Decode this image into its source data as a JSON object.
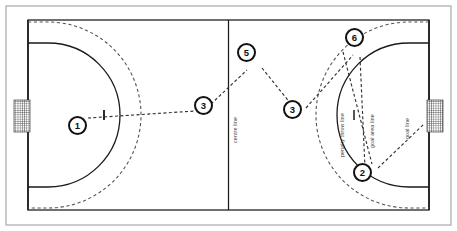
{
  "diagram": {
    "sport": "handball",
    "colors": {
      "court_line": "#1a1a1a",
      "goal_area_line": "#1a1a1a",
      "free_throw_line": "#555555",
      "pass_line": "#333333",
      "frame": "#9a9a9a",
      "net": "#4a4a4a",
      "background": "#ffffff",
      "label_text": "#3a3a3a"
    },
    "frame": {
      "left": 6,
      "top": 6,
      "width": 445,
      "height": 219
    },
    "court": {
      "left": 28,
      "top": 20,
      "width": 401,
      "height": 190
    },
    "centre_line_x": 228.5
  },
  "labels": [
    {
      "name": "centre-line",
      "text": "centre line",
      "x": 232,
      "y": 143,
      "rotation": -90
    },
    {
      "name": "penalty-throw-line",
      "text": "penalty throw line",
      "x": 339,
      "y": 157,
      "rotation": -90
    },
    {
      "name": "goal-area-line",
      "text": "goal area line",
      "x": 369,
      "y": 148,
      "rotation": -90
    },
    {
      "name": "goal-line",
      "text": "goal line",
      "x": 404,
      "y": 139,
      "rotation": -90
    }
  ],
  "goals": [
    {
      "name": "goal-left",
      "x": 14,
      "y": 100,
      "width": 16,
      "height": 32
    },
    {
      "name": "goal-right",
      "x": 427,
      "y": 100,
      "width": 16,
      "height": 32
    }
  ],
  "penalty_marks": [
    {
      "name": "penalty-mark-left",
      "x": 104,
      "y": 115
    },
    {
      "name": "penalty-mark-right",
      "x": 354,
      "y": 115
    }
  ],
  "players": [
    {
      "id": "1",
      "label": "1",
      "x": 77,
      "y": 126,
      "name": "player-marker-1"
    },
    {
      "id": "3a",
      "label": "3",
      "x": 203,
      "y": 106,
      "name": "player-marker-3-left"
    },
    {
      "id": "5",
      "label": "5",
      "x": 246,
      "y": 53,
      "name": "player-marker-5"
    },
    {
      "id": "3b",
      "label": "3",
      "x": 292,
      "y": 110,
      "name": "player-marker-3-right"
    },
    {
      "id": "6",
      "label": "6",
      "x": 354,
      "y": 38,
      "name": "player-marker-6"
    },
    {
      "id": "2",
      "label": "2",
      "x": 362,
      "y": 173,
      "name": "player-marker-2"
    }
  ],
  "passes": [
    {
      "name": "pass-1-to-3",
      "from": "1",
      "to": "3a"
    },
    {
      "name": "pass-3-to-5",
      "from": "3a",
      "to": "5"
    },
    {
      "name": "pass-5-to-3",
      "from": "5",
      "to": "3b"
    },
    {
      "name": "pass-3-to-6",
      "from": "3b",
      "to": "6"
    },
    {
      "name": "pass-6-to-2",
      "from": "6",
      "to": "2"
    },
    {
      "name": "shot-2-to-goal",
      "from": "2",
      "to": "goal-right"
    }
  ]
}
